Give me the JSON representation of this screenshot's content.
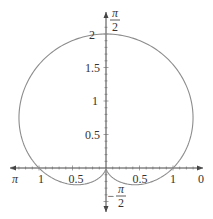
{
  "chart_data": {
    "type": "line",
    "subtype": "polar",
    "title": "",
    "equation": "r = 1 + sin(theta)",
    "curve_color": "#8c8c8c",
    "axis_color": "#444444",
    "axis_range": {
      "x": [
        -1.5,
        1.5
      ],
      "y": [
        -0.5,
        2
      ]
    },
    "grid": false,
    "angle_labels": {
      "top": {
        "num": "π",
        "den": "2",
        "sign": ""
      },
      "bottom": {
        "num": "π",
        "den": "2",
        "sign": "−"
      },
      "left": "π",
      "right": "0"
    },
    "x_tick_labels": {
      "left_1": "1",
      "left_05": "0.5",
      "right_05": "0.5",
      "right_1": "1"
    },
    "y_tick_labels": {
      "y2": "2",
      "y15": "1.5",
      "y1": "1",
      "y05": "0.5"
    },
    "points": [
      {
        "theta": "0",
        "r": 1
      },
      {
        "theta": "π/2",
        "r": 2
      },
      {
        "theta": "π",
        "r": 1
      },
      {
        "theta": "-π/2",
        "r": 0
      }
    ]
  }
}
